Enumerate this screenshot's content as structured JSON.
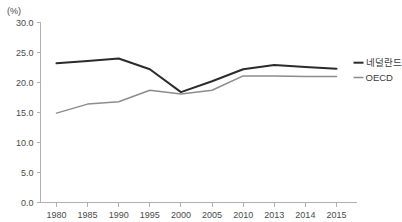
{
  "chart_data": {
    "type": "line",
    "title": "",
    "xlabel": "",
    "ylabel": "(%)",
    "unit_label": "(%)",
    "categories": [
      "1980",
      "1985",
      "1990",
      "1995",
      "2000",
      "2005",
      "2010",
      "2013",
      "2014",
      "2015"
    ],
    "ylim": [
      0.0,
      30.0
    ],
    "ytick_labels": [
      "30.0",
      "25.0",
      "20.0",
      "15.0",
      "10.0",
      "5.0",
      "0.0"
    ],
    "ytick_values": [
      30.0,
      25.0,
      20.0,
      15.0,
      10.0,
      5.0,
      0.0
    ],
    "grid": false,
    "legend_position": "right-inline",
    "series": [
      {
        "name": "네덜란드",
        "color": "#2b2b2b",
        "values": [
          23.2,
          23.6,
          24.0,
          22.2,
          18.4,
          20.2,
          22.2,
          22.9,
          22.6,
          22.3
        ]
      },
      {
        "name": "OECD",
        "color": "#8c8c8c",
        "values": [
          14.9,
          16.4,
          16.8,
          18.7,
          18.1,
          18.7,
          21.1,
          21.1,
          21.0,
          21.0
        ]
      }
    ]
  },
  "colors": {
    "axis": "#b0b0b0",
    "text": "#4a4a4a",
    "background": "#ffffff",
    "series_netherlands": "#2b2b2b",
    "series_oecd": "#8c8c8c"
  }
}
